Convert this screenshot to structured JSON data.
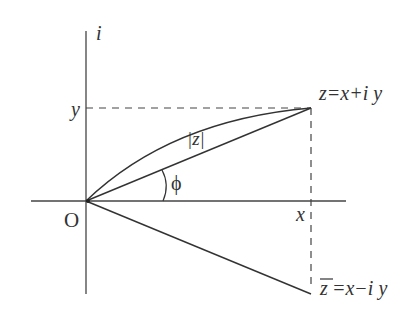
{
  "diagram": {
    "type": "complex-plane",
    "axis_labels": {
      "imaginary": "i",
      "origin": "O"
    },
    "tick_labels": {
      "y": "y",
      "x": "x"
    },
    "point_z": {
      "label": "z=x+i y"
    },
    "point_zbar": {
      "label_bar": "z",
      "label_rest": "=x−i y"
    },
    "modulus_label": "|z|",
    "angle_label": "ϕ",
    "colors": {
      "stroke": "#333333",
      "background": "#ffffff"
    }
  }
}
